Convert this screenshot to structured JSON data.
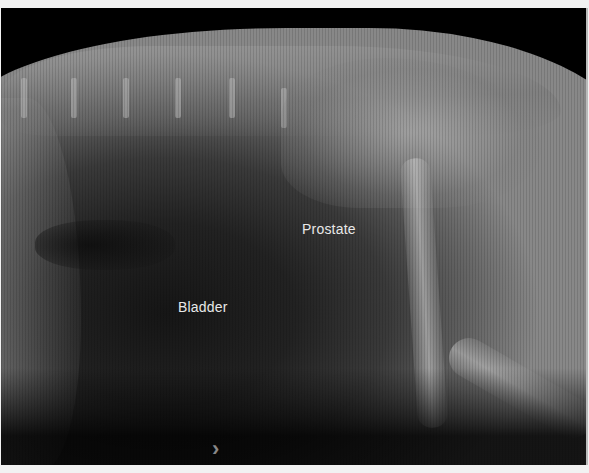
{
  "image": {
    "description": "Lateral abdominal radiograph (X-ray) with anatomical labels",
    "labels": {
      "prostate": "Prostate",
      "bladder": "Bladder"
    },
    "next_arrow": "›"
  }
}
